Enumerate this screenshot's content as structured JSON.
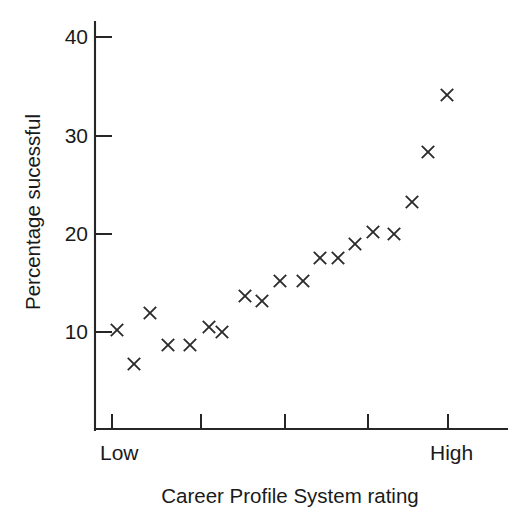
{
  "chart_data": {
    "type": "scatter",
    "title": "",
    "xlabel": "Career Profile System rating",
    "ylabel": "Percentage sucessful",
    "xlim": [
      0,
      6
    ],
    "ylim": [
      0,
      44
    ],
    "grid": false,
    "legend": null,
    "y_ticks": [
      10,
      20,
      30,
      40
    ],
    "y_tick_labels": [
      "10",
      "20",
      "30",
      "40"
    ],
    "x_tick_labels": [
      "Low",
      "High"
    ],
    "x_tick_count": 5,
    "marker": "x",
    "marker_color": "#2b2b2b",
    "x": [
      1.0,
      1.2,
      1.42,
      1.63,
      1.9,
      2.12,
      2.28,
      2.55,
      2.76,
      2.98,
      3.25,
      3.46,
      3.67,
      3.87,
      4.09,
      4.34,
      4.55,
      4.74,
      4.97
    ],
    "y": [
      10.2,
      7.3,
      12.1,
      9.2,
      9.2,
      11.1,
      10.5,
      13.9,
      13.4,
      15.4,
      15.4,
      17.7,
      17.7,
      19.1,
      20.3,
      20.1,
      23.4,
      28.3,
      34.1
    ],
    "points": [
      {
        "px": 117,
        "py": 330,
        "value": 10.2
      },
      {
        "px": 134,
        "py": 364,
        "value": 7.3
      },
      {
        "px": 150,
        "py": 313,
        "value": 12.1
      },
      {
        "px": 168,
        "py": 345,
        "value": 9.2
      },
      {
        "px": 190,
        "py": 345,
        "value": 9.2
      },
      {
        "px": 209,
        "py": 327,
        "value": 11.1
      },
      {
        "px": 222,
        "py": 332,
        "value": 10.5
      },
      {
        "px": 245,
        "py": 296,
        "value": 13.9
      },
      {
        "px": 262,
        "py": 301,
        "value": 13.4
      },
      {
        "px": 280,
        "py": 281,
        "value": 15.4
      },
      {
        "px": 303,
        "py": 281,
        "value": 15.4
      },
      {
        "px": 320,
        "py": 258,
        "value": 17.7
      },
      {
        "px": 338,
        "py": 258,
        "value": 17.7
      },
      {
        "px": 355,
        "py": 244,
        "value": 19.1
      },
      {
        "px": 373,
        "py": 232,
        "value": 20.3
      },
      {
        "px": 394,
        "py": 234,
        "value": 20.1
      },
      {
        "px": 412,
        "py": 202,
        "value": 23.4
      },
      {
        "px": 428,
        "py": 152,
        "value": 28.3
      },
      {
        "px": 447,
        "py": 95,
        "value": 34.1
      }
    ]
  },
  "axes": {
    "y_axis": {
      "line": {
        "x": 95,
        "y1": 22,
        "y2": 430
      },
      "ticks": [
        {
          "label": "40",
          "y": 37
        },
        {
          "label": "30",
          "y": 136
        },
        {
          "label": "20",
          "y": 234
        },
        {
          "label": "10",
          "y": 332
        }
      ],
      "tick_length": 17,
      "label_x": 88
    },
    "x_axis": {
      "line": {
        "y": 429,
        "x1": 95,
        "x2": 507
      },
      "ticks": [
        112,
        201,
        285,
        368,
        448
      ],
      "tick_length": 15,
      "categories": [
        {
          "label": "Low",
          "x": 100
        },
        {
          "label": "High",
          "x": 430
        }
      ]
    }
  },
  "labels": {
    "y_axis_title": "Percentage sucessful",
    "x_axis_title": "Career Profile System rating",
    "y_title_pos": {
      "x": 40,
      "y": 212
    },
    "x_title_pos": {
      "x": 290,
      "y": 503
    }
  }
}
